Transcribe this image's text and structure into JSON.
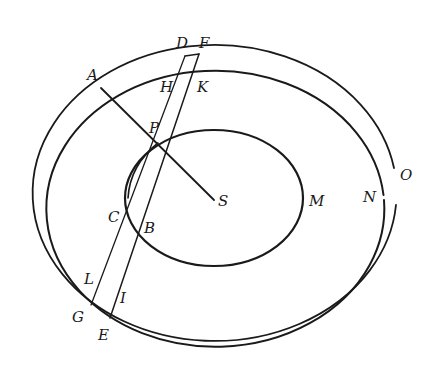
{
  "diagram": {
    "type": "orbital geometry",
    "stroke_color": "#1a1a1a",
    "background": "#ffffff",
    "curves": {
      "inner_orbit": {
        "cx": 214,
        "cy": 198,
        "rx": 89,
        "ry": 68
      },
      "outer_orbit_inner": {
        "cx": 215,
        "cy": 198,
        "rx": 169,
        "ry": 138
      },
      "outer_orbit_outer": {
        "cx": 214,
        "cy": 198,
        "rx": 182,
        "ry": 148
      }
    },
    "points": {
      "P": {
        "x": 158,
        "y": 143
      },
      "S": {
        "x": 214,
        "y": 200
      },
      "A": {
        "x": 101,
        "y": 88
      },
      "D": {
        "x": 185,
        "y": 56
      },
      "F": {
        "x": 199,
        "y": 54
      },
      "H": {
        "x": 182,
        "y": 66
      },
      "K": {
        "x": 194,
        "y": 64
      },
      "C": {
        "x": 128,
        "y": 198
      },
      "B": {
        "x": 135,
        "y": 213
      },
      "L": {
        "x": 96,
        "y": 296
      },
      "I": {
        "x": 112,
        "y": 307
      },
      "G": {
        "x": 91,
        "y": 305
      },
      "E": {
        "x": 110,
        "y": 318
      }
    },
    "labels": [
      {
        "id": "A",
        "text": "A",
        "x": 87,
        "y": 80
      },
      {
        "id": "D",
        "text": "D",
        "x": 176,
        "y": 48
      },
      {
        "id": "F",
        "text": "F",
        "x": 199,
        "y": 48
      },
      {
        "id": "H",
        "text": "H",
        "x": 160,
        "y": 92
      },
      {
        "id": "K",
        "text": "K",
        "x": 197,
        "y": 92
      },
      {
        "id": "P",
        "text": "P",
        "x": 149,
        "y": 133
      },
      {
        "id": "S",
        "text": "S",
        "x": 218,
        "y": 206
      },
      {
        "id": "M",
        "text": "M",
        "x": 309,
        "y": 206
      },
      {
        "id": "N",
        "text": "N",
        "x": 363,
        "y": 202
      },
      {
        "id": "O",
        "text": "O",
        "x": 400,
        "y": 180
      },
      {
        "id": "C",
        "text": "C",
        "x": 108,
        "y": 222
      },
      {
        "id": "B",
        "text": "B",
        "x": 144,
        "y": 233
      },
      {
        "id": "L",
        "text": "L",
        "x": 84,
        "y": 284
      },
      {
        "id": "I",
        "text": "I",
        "x": 120,
        "y": 303
      },
      {
        "id": "G",
        "text": "G",
        "x": 72,
        "y": 322
      },
      {
        "id": "E",
        "text": "E",
        "x": 98,
        "y": 340
      }
    ]
  }
}
